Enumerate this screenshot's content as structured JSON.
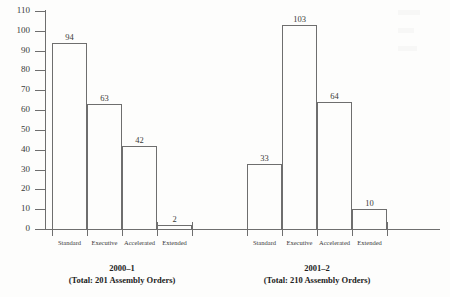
{
  "figure": {
    "background_color": "#fdfdfc",
    "line_color": "#6e6e6e",
    "text_color": "#3a3a3a"
  },
  "chart_data": {
    "type": "bar",
    "title": "",
    "subtitle": "",
    "xlabel": "",
    "ylabel": "",
    "ylim": [
      0,
      110
    ],
    "y_ticks": [
      0,
      10,
      20,
      30,
      40,
      50,
      60,
      70,
      80,
      90,
      100,
      110
    ],
    "grid": false,
    "legend": false,
    "legend_position": "none",
    "bar_style": "outlined-unfilled-adjacent",
    "categories": [
      "Standard",
      "Executive",
      "Accelerated",
      "Extended"
    ],
    "groups": [
      {
        "name": "2000-1",
        "period_label": "2000–1",
        "total_label": "(Total:  201 Assembly Orders)",
        "total_value": 201,
        "values": [
          94,
          63,
          42,
          2
        ],
        "value_labels": [
          "94",
          "63",
          "42",
          "2"
        ]
      },
      {
        "name": "2001-2",
        "period_label": "2001–2",
        "total_label": "(Total:  210 Assembly Orders)",
        "total_value": 210,
        "values": [
          33,
          103,
          64,
          10
        ],
        "value_labels": [
          "33",
          "103",
          "64",
          "10"
        ]
      }
    ]
  }
}
